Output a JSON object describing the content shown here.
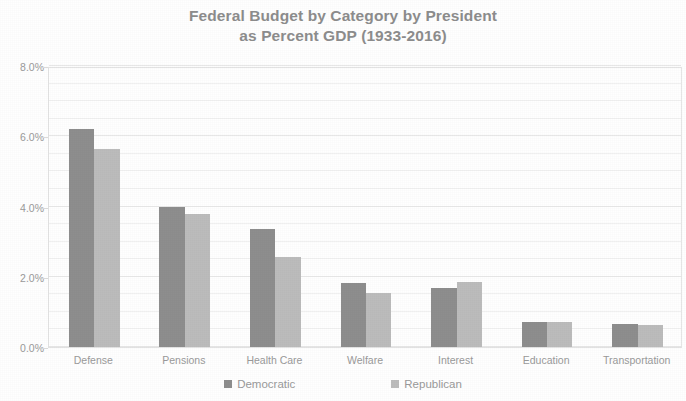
{
  "chart_data": {
    "type": "bar",
    "title": "Federal Budget by Category by President as Percent GDP (1933-2016)",
    "title_line1": "Federal Budget by Category by President",
    "title_line2": "as Percent GDP (1933-2016)",
    "subtitle": "",
    "xlabel": "",
    "ylabel": "",
    "ylim": [
      0,
      8
    ],
    "ytick_labels": [
      "0.0%",
      "2.0%",
      "4.0%",
      "6.0%",
      "8.0%"
    ],
    "ytick_values": [
      0,
      2,
      4,
      6,
      8
    ],
    "minor_tick_interval": 0.5,
    "grid": true,
    "legend_position": "bottom",
    "categories": [
      "Defense",
      "Pensions",
      "Health Care",
      "Welfare",
      "Interest",
      "Education",
      "Transportation"
    ],
    "series": [
      {
        "name": "Democratic",
        "color": "#8e8e8e",
        "values": [
          6.2,
          4.0,
          3.35,
          1.82,
          1.68,
          0.72,
          0.65
        ]
      },
      {
        "name": "Republican",
        "color": "#bcbcbc",
        "values": [
          5.65,
          3.8,
          2.55,
          1.55,
          1.85,
          0.72,
          0.62
        ]
      }
    ],
    "annotations": []
  },
  "colors": {
    "title_text": "#8d8d8d",
    "axis_text": "#9a9a9a",
    "gridline": "#e8e8e8",
    "gridline_minor": "#f1f1f1",
    "plot_border": "#e3e3e3",
    "democratic": "#8e8e8e",
    "republican": "#bcbcbc",
    "background": "#ffffff"
  }
}
